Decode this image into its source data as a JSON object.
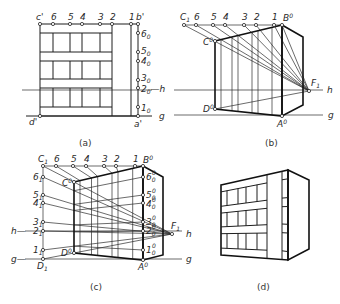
{
  "figure": {
    "panels": [
      {
        "id": "a",
        "caption": "(a)"
      },
      {
        "id": "b",
        "caption": "(b)"
      },
      {
        "id": "c",
        "caption": "(c)"
      },
      {
        "id": "d",
        "caption": "(d)"
      }
    ]
  },
  "panel_a": {
    "top_points": [
      {
        "main": "c'",
        "sub": ""
      },
      {
        "main": "6",
        "sub": ""
      },
      {
        "main": "5",
        "sub": ""
      },
      {
        "main": "4",
        "sub": ""
      },
      {
        "main": "3",
        "sub": ""
      },
      {
        "main": "2",
        "sub": ""
      },
      {
        "main": "1",
        "sub": ""
      },
      {
        "main": "b'",
        "sub": ""
      }
    ],
    "side_points": [
      {
        "main": "6",
        "sub": "0"
      },
      {
        "main": "5",
        "sub": "0"
      },
      {
        "main": "4",
        "sub": "0"
      },
      {
        "main": "3",
        "sub": "0"
      },
      {
        "main": "2",
        "sub": "0"
      },
      {
        "main": "1",
        "sub": "0"
      }
    ],
    "horizon_suffix": "—h",
    "ground_label": "g",
    "bottom_left": "d'",
    "bottom_right": "a'"
  },
  "panel_b": {
    "top_points": [
      {
        "main": "C",
        "sub": "1",
        "sup": ""
      },
      {
        "main": "6",
        "sub": "",
        "sup": ""
      },
      {
        "main": "5",
        "sub": "",
        "sup": ""
      },
      {
        "main": "4",
        "sub": "",
        "sup": ""
      },
      {
        "main": "3",
        "sub": "",
        "sup": ""
      },
      {
        "main": "2",
        "sub": "",
        "sup": ""
      },
      {
        "main": "1",
        "sub": "",
        "sup": ""
      },
      {
        "main": "B",
        "sub": "",
        "sup": "0"
      }
    ],
    "c0": {
      "main": "C",
      "sup": "0"
    },
    "d0": {
      "main": "D",
      "sup": "0"
    },
    "a0": {
      "main": "A",
      "sup": "0"
    },
    "vanishing_point": {
      "main": "F",
      "sub": "1"
    },
    "horizon_label": "h",
    "ground_label": "g"
  },
  "panel_c": {
    "top_points": [
      {
        "main": "C",
        "sub": "1",
        "sup": ""
      },
      {
        "main": "6",
        "sub": "",
        "sup": ""
      },
      {
        "main": "5",
        "sub": "",
        "sup": ""
      },
      {
        "main": "4",
        "sub": "",
        "sup": ""
      },
      {
        "main": "3",
        "sub": "",
        "sup": ""
      },
      {
        "main": "2",
        "sub": "",
        "sup": ""
      },
      {
        "main": "1",
        "sub": "",
        "sup": ""
      },
      {
        "main": "B",
        "sub": "",
        "sup": "0"
      }
    ],
    "left_points": [
      {
        "main": "6",
        "sub": "1"
      },
      {
        "main": "5",
        "sub": "1"
      },
      {
        "main": "4",
        "sub": "1"
      },
      {
        "main": "3",
        "sub": "1"
      },
      {
        "main": "2",
        "sub": "1"
      },
      {
        "main": "1",
        "sub": "1"
      }
    ],
    "right_points": [
      {
        "main": "6",
        "sub": "0",
        "sup": "0"
      },
      {
        "main": "5",
        "sub": "0",
        "sup": "0"
      },
      {
        "main": "4",
        "sub": "0",
        "sup": "0"
      },
      {
        "main": "3",
        "sub": "0",
        "sup": "0"
      },
      {
        "main": "2",
        "sub": "0",
        "sup": "0"
      },
      {
        "main": "1",
        "sub": "0",
        "sup": "0"
      }
    ],
    "c0": {
      "main": "C",
      "sup": "0"
    },
    "d0": {
      "main": "D",
      "sup": "0"
    },
    "d1": {
      "main": "D",
      "sub": "1"
    },
    "a0": {
      "main": "A",
      "sup": "0"
    },
    "vanishing_point": {
      "main": "F",
      "sub": "1"
    },
    "horizon_left": "h—",
    "horizon_right": "h",
    "ground_left": "g—",
    "ground_right": "g"
  }
}
